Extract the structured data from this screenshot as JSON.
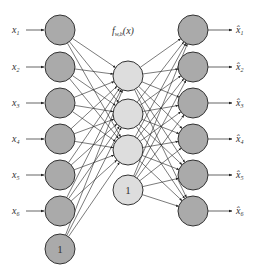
{
  "function_label": {
    "f": "f",
    "sub": "w,b",
    "arg": "(x)"
  },
  "colors": {
    "outer_node_fill": "#aaaaaa",
    "hidden_node_fill": "#dddddd",
    "node_stroke": "#333333",
    "edge": "#222222",
    "text": "#333333"
  },
  "input_layer": {
    "nodes": [
      {
        "label": "x",
        "sub": "1",
        "y": 30
      },
      {
        "label": "x",
        "sub": "2",
        "y": 67
      },
      {
        "label": "x",
        "sub": "3",
        "y": 103
      },
      {
        "label": "x",
        "sub": "4",
        "y": 139
      },
      {
        "label": "x",
        "sub": "5",
        "y": 175
      },
      {
        "label": "x",
        "sub": "6",
        "y": 211
      }
    ],
    "bias": {
      "label": "1",
      "y": 249
    },
    "x": 60
  },
  "hidden_layer": {
    "nodes": [
      {
        "y": 76
      },
      {
        "y": 114
      },
      {
        "y": 150
      }
    ],
    "bias": {
      "label": "1",
      "y": 190
    },
    "x": 128
  },
  "output_layer": {
    "nodes": [
      {
        "label": "x̂",
        "sub": "1",
        "y": 30
      },
      {
        "label": "x̂",
        "sub": "2",
        "y": 67
      },
      {
        "label": "x̂",
        "sub": "3",
        "y": 103
      },
      {
        "label": "x̂",
        "sub": "4",
        "y": 139
      },
      {
        "label": "x̂",
        "sub": "5",
        "y": 175
      },
      {
        "label": "x̂",
        "sub": "6",
        "y": 211
      }
    ],
    "x": 193
  }
}
